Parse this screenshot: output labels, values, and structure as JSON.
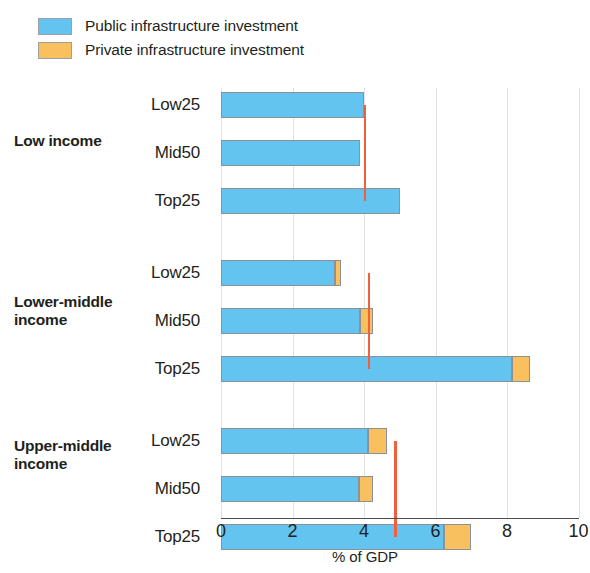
{
  "legend": {
    "items": [
      {
        "label": "Public infrastructure investment",
        "color": "#62c4ef",
        "key": "public"
      },
      {
        "label": "Private infrastructure investment",
        "color": "#f9c15e",
        "key": "private"
      }
    ]
  },
  "axis": {
    "x_title": "% of GDP",
    "ticks": [
      "0",
      "2",
      "4",
      "6",
      "8",
      "10"
    ]
  },
  "groups": [
    {
      "name": "Low income",
      "label_lines": [
        "Low income"
      ]
    },
    {
      "name": "Lower-middle income",
      "label_lines": [
        "Lower-middle",
        "income"
      ]
    },
    {
      "name": "Upper-middle income",
      "label_lines": [
        "Upper-middle",
        "income"
      ]
    }
  ],
  "categories": [
    "Low25",
    "Mid50",
    "Top25"
  ],
  "colors": {
    "public": "#62c4ef",
    "private": "#f9c15e",
    "median_line": "#f1603c",
    "grid": "#dfe3e6",
    "axis": "#4d4d4d",
    "text": "#231f20"
  },
  "chart_data": {
    "type": "bar",
    "orientation": "horizontal",
    "stacked": true,
    "title": "",
    "xlabel": "% of GDP",
    "ylabel": "",
    "xlim": [
      0,
      10
    ],
    "xticks": [
      0,
      2,
      4,
      6,
      8,
      10
    ],
    "grid": "vertical",
    "legend_position": "top-left",
    "series": [
      {
        "name": "Public infrastructure investment",
        "color": "#62c4ef"
      },
      {
        "name": "Private infrastructure investment",
        "color": "#f9c15e"
      }
    ],
    "groups": [
      {
        "name": "Low income",
        "median_reference": 4.0,
        "bars": [
          {
            "category": "Low25",
            "public": 4.0,
            "private": 0.0,
            "total": 4.0
          },
          {
            "category": "Mid50",
            "public": 3.9,
            "private": 0.0,
            "total": 3.9
          },
          {
            "category": "Top25",
            "public": 5.0,
            "private": 0.0,
            "total": 5.0
          }
        ]
      },
      {
        "name": "Lower-middle income",
        "median_reference": 4.1,
        "bars": [
          {
            "category": "Low25",
            "public": 3.2,
            "private": 0.15,
            "total": 3.35
          },
          {
            "category": "Mid50",
            "public": 3.9,
            "private": 0.35,
            "total": 4.25
          },
          {
            "category": "Top25",
            "public": 8.15,
            "private": 0.5,
            "total": 8.65
          }
        ]
      },
      {
        "name": "Upper-middle income",
        "median_reference": 4.85,
        "bars": [
          {
            "category": "Low25",
            "public": 4.1,
            "private": 0.55,
            "total": 4.65
          },
          {
            "category": "Mid50",
            "public": 3.85,
            "private": 0.4,
            "total": 4.25
          },
          {
            "category": "Top25",
            "public": 6.25,
            "private": 0.75,
            "total": 7.0
          }
        ]
      }
    ]
  },
  "layout": {
    "plot_left_px": 221,
    "plot_top_px": 88,
    "px_per_unit": 35.75,
    "bar_height_px": 26,
    "row_tops_px": [
      4,
      52,
      100,
      172,
      220,
      268,
      340,
      388,
      436
    ],
    "group_label_tops_px": [
      132,
      293,
      437
    ]
  }
}
